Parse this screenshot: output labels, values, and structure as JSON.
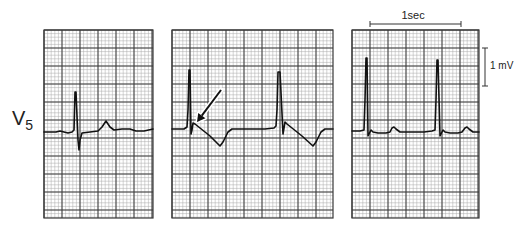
{
  "figure": {
    "lead_label": {
      "main": "V",
      "subscript": "5"
    },
    "scale_bars": {
      "time": {
        "label": "1sec",
        "x1": 370,
        "x2": 461,
        "y": 24
      },
      "voltage": {
        "label": "1 mV",
        "x": 485,
        "y1": 48,
        "y2": 86
      }
    },
    "grid": {
      "major_px": 18,
      "minor_div": 5,
      "major_color": "#3a3a3a",
      "minor_color": "#a8a8a8",
      "background": "#ffffff"
    },
    "trace_color": "#111111",
    "panels": [
      {
        "id": "panel-1",
        "x": 44,
        "y": 30,
        "w": 109,
        "h": 188,
        "trace": [
          [
            44,
            132
          ],
          [
            56,
            132
          ],
          [
            60,
            131
          ],
          [
            64,
            132
          ],
          [
            68,
            133
          ],
          [
            72,
            132
          ],
          [
            74,
            130
          ],
          [
            75,
            92
          ],
          [
            76,
            92
          ],
          [
            78,
            140
          ],
          [
            79,
            150
          ],
          [
            80,
            140
          ],
          [
            82,
            133
          ],
          [
            90,
            132
          ],
          [
            98,
            131
          ],
          [
            102,
            127
          ],
          [
            106,
            121
          ],
          [
            110,
            127
          ],
          [
            114,
            130
          ],
          [
            122,
            129
          ],
          [
            130,
            129
          ],
          [
            136,
            131
          ],
          [
            144,
            131
          ],
          [
            153,
            129
          ]
        ]
      },
      {
        "id": "panel-2",
        "x": 172,
        "y": 30,
        "w": 161,
        "h": 188,
        "trace": [
          [
            172,
            129
          ],
          [
            184,
            129
          ],
          [
            187,
            127
          ],
          [
            188,
            110
          ],
          [
            189,
            70
          ],
          [
            190,
            70
          ],
          [
            191,
            134
          ],
          [
            192,
            130
          ],
          [
            193,
            123
          ],
          [
            195,
            124
          ],
          [
            200,
            128
          ],
          [
            210,
            136
          ],
          [
            220,
            146
          ],
          [
            223,
            142
          ],
          [
            228,
            132
          ],
          [
            232,
            129
          ],
          [
            250,
            129
          ],
          [
            265,
            129
          ],
          [
            274,
            128
          ],
          [
            276,
            126
          ],
          [
            277,
            110
          ],
          [
            278,
            72
          ],
          [
            280,
            72
          ],
          [
            283,
            134
          ],
          [
            284,
            128
          ],
          [
            285,
            122
          ],
          [
            287,
            124
          ],
          [
            292,
            128
          ],
          [
            302,
            136
          ],
          [
            313,
            146
          ],
          [
            316,
            142
          ],
          [
            321,
            132
          ],
          [
            325,
            129
          ],
          [
            333,
            129
          ]
        ]
      },
      {
        "id": "panel-3",
        "x": 352,
        "y": 30,
        "w": 127,
        "h": 188,
        "trace": [
          [
            352,
            131
          ],
          [
            360,
            131
          ],
          [
            364,
            130
          ],
          [
            365,
            100
          ],
          [
            366,
            58
          ],
          [
            367,
            58
          ],
          [
            368,
            136
          ],
          [
            369,
            134
          ],
          [
            371,
            130
          ],
          [
            373,
            132
          ],
          [
            378,
            133
          ],
          [
            386,
            133
          ],
          [
            390,
            132
          ],
          [
            392,
            128
          ],
          [
            394,
            127
          ],
          [
            396,
            129
          ],
          [
            400,
            132
          ],
          [
            412,
            132
          ],
          [
            424,
            132
          ],
          [
            432,
            131
          ],
          [
            435,
            130
          ],
          [
            436,
            100
          ],
          [
            437,
            60
          ],
          [
            438,
            60
          ],
          [
            440,
            136
          ],
          [
            441,
            134
          ],
          [
            443,
            130
          ],
          [
            445,
            132
          ],
          [
            450,
            133
          ],
          [
            458,
            133
          ],
          [
            462,
            132
          ],
          [
            465,
            128
          ],
          [
            467,
            127
          ],
          [
            469,
            129
          ],
          [
            473,
            132
          ],
          [
            479,
            132
          ]
        ]
      }
    ],
    "arrow": {
      "from": [
        221,
        90
      ],
      "to": [
        197,
        122
      ],
      "target": "delta-wave notch in panel 2"
    }
  }
}
